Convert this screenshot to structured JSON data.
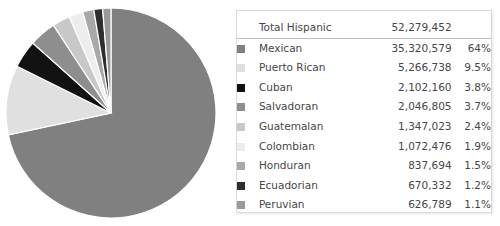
{
  "chart_data": {
    "type": "pie",
    "title": "",
    "total_label": "Total Hispanic",
    "total_value": "52,279,452",
    "total_value_num": 52279452,
    "categories": [
      "Mexican",
      "Puerto Rican",
      "Cuban",
      "Salvadoran",
      "Guatemalan",
      "Colombian",
      "Honduran",
      "Ecuadorian",
      "Peruvian"
    ],
    "values": [
      35320579,
      5266738,
      2102160,
      2046805,
      1347023,
      1072476,
      837694,
      670332,
      626789
    ],
    "value_labels": [
      "35,320,579",
      "5,266,738",
      "2,102,160",
      "2,046,805",
      "1,347,023",
      "1,072,476",
      "837,694",
      "670,332",
      "626,789"
    ],
    "percent_labels": [
      "64%",
      "9.5%",
      "3.8%",
      "3.7%",
      "2.4%",
      "1.9%",
      "1.5%",
      "1.2%",
      "1.1%"
    ],
    "percents": [
      64.0,
      9.5,
      3.8,
      3.7,
      2.4,
      1.9,
      1.5,
      1.2,
      1.1
    ],
    "colors": [
      "#808080",
      "#e0e0e0",
      "#121212",
      "#8e8e8e",
      "#c8c8c8",
      "#ededed",
      "#a8a8a8",
      "#2e2e2e",
      "#9a9a9a"
    ],
    "legend_position": "right",
    "start_angle_deg": 0,
    "direction": "clockwise",
    "grid": false
  },
  "pie": {
    "name": "hispanic-origin-pie",
    "center_x": 107,
    "center_y": 107,
    "radius": 105,
    "separator_color": "#ffffff"
  },
  "legend": {
    "panel_name": "legend-panel",
    "total_row": {
      "label": "Total Hispanic",
      "value": "52,279,452",
      "percent": ""
    },
    "rows": [
      {
        "label": "Mexican",
        "value": "35,320,579",
        "percent": "64%",
        "color": "#808080"
      },
      {
        "label": "Puerto Rican",
        "value": "5,266,738",
        "percent": "9.5%",
        "color": "#e0e0e0"
      },
      {
        "label": "Cuban",
        "value": "2,102,160",
        "percent": "3.8%",
        "color": "#121212"
      },
      {
        "label": "Salvadoran",
        "value": "2,046,805",
        "percent": "3.7%",
        "color": "#8e8e8e"
      },
      {
        "label": "Guatemalan",
        "value": "1,347,023",
        "percent": "2.4%",
        "color": "#c8c8c8"
      },
      {
        "label": "Colombian",
        "value": "1,072,476",
        "percent": "1.9%",
        "color": "#ededed"
      },
      {
        "label": "Honduran",
        "value": "837,694",
        "percent": "1.5%",
        "color": "#a8a8a8"
      },
      {
        "label": "Ecuadorian",
        "value": "670,332",
        "percent": "1.2%",
        "color": "#2e2e2e"
      },
      {
        "label": "Peruvian",
        "value": "626,789",
        "percent": "1.1%",
        "color": "#9a9a9a"
      }
    ]
  },
  "colors": {
    "page_background": "#ffffff",
    "panel_background": "#ffffff",
    "panel_border": "#d9d9d9",
    "rule": "#bfbfbf",
    "text": "#464646"
  }
}
